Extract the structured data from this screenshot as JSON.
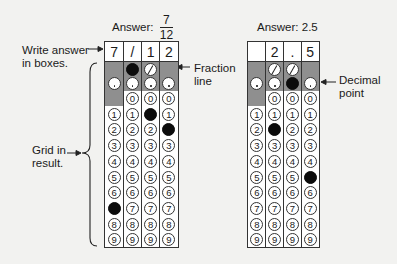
{
  "left_grid": {
    "answer_label": "Answer:",
    "answer_numerator": "7",
    "answer_denominator": "12",
    "boxes": [
      "7",
      "/",
      "1",
      "2"
    ],
    "slash_row": [
      null,
      "filled",
      "empty",
      null
    ],
    "decimal_row": [
      "empty",
      "empty",
      "empty",
      "empty"
    ],
    "digit_columns": [
      {
        "has_zero": false,
        "filled_digit": 7
      },
      {
        "has_zero": true,
        "filled_digit": null
      },
      {
        "has_zero": true,
        "filled_digit": 1
      },
      {
        "has_zero": true,
        "filled_digit": 2
      }
    ]
  },
  "right_grid": {
    "answer_label": "Answer: 2.5",
    "boxes": [
      "",
      "2",
      ".",
      "5"
    ],
    "slash_row": [
      null,
      "empty",
      "empty",
      null
    ],
    "decimal_row": [
      "empty",
      "empty",
      "filled",
      "empty"
    ],
    "digit_columns": [
      {
        "has_zero": false,
        "filled_digit": null
      },
      {
        "has_zero": true,
        "filled_digit": 2
      },
      {
        "has_zero": true,
        "filled_digit": null
      },
      {
        "has_zero": true,
        "filled_digit": 5
      }
    ]
  },
  "annotations": {
    "write_answer_line1": "Write answer",
    "write_answer_line2": "in boxes.",
    "grid_in_line1": "Grid in",
    "grid_in_line2": "result.",
    "fraction_line1": "Fraction",
    "fraction_line2": "line",
    "decimal_line1": "Decimal",
    "decimal_line2": "point"
  },
  "digits": [
    "0",
    "1",
    "2",
    "3",
    "4",
    "5",
    "6",
    "7",
    "8",
    "9"
  ],
  "colors": {
    "shade": "#8f8f8f",
    "fill": "#0c0c0c",
    "background": "#f2f2f0"
  }
}
